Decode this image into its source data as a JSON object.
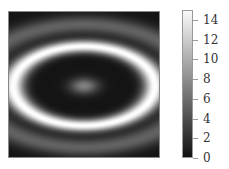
{
  "chart_data": {
    "type": "heatmap",
    "title": "",
    "xlabel": "",
    "ylabel": "",
    "colormap": "gray",
    "colorbar": {
      "ticks": [
        0,
        2,
        4,
        6,
        8,
        10,
        12,
        14
      ],
      "range": [
        0,
        15
      ]
    },
    "grid": 48,
    "pattern": {
      "center_value": 7,
      "ring_peak_value": 15,
      "ring_radius_x": 0.95,
      "ring_radius_y": 0.55,
      "aspect_x_over_y": 1.7
    }
  },
  "colorbar_labels": [
    "0",
    "2",
    "4",
    "6",
    "8",
    "10",
    "12",
    "14"
  ]
}
